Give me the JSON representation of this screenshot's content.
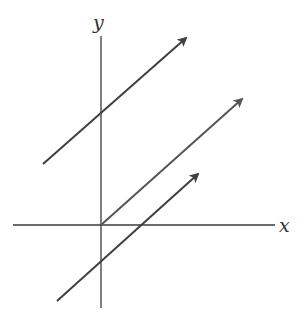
{
  "diagram": {
    "type": "coordinate-plane-parallel-vectors",
    "axes": {
      "x_label": "x",
      "y_label": "y",
      "color": "#3a3a3a"
    },
    "vectors": [
      {
        "name": "upper",
        "from": [
          43,
          164
        ],
        "to": [
          186,
          38
        ],
        "y_intercept_px": [
          101,
          113
        ],
        "color": "#3f3f3f"
      },
      {
        "name": "middle",
        "from": [
          101,
          225
        ],
        "to": [
          242,
          99
        ],
        "starts_at": "origin",
        "color": "#555555"
      },
      {
        "name": "lower",
        "from": [
          57,
          301
        ],
        "to": [
          198,
          174
        ],
        "y_intercept_px": [
          101,
          262
        ],
        "x_intercept_px": [
          142,
          225
        ],
        "color": "#3f3f3f"
      }
    ]
  }
}
